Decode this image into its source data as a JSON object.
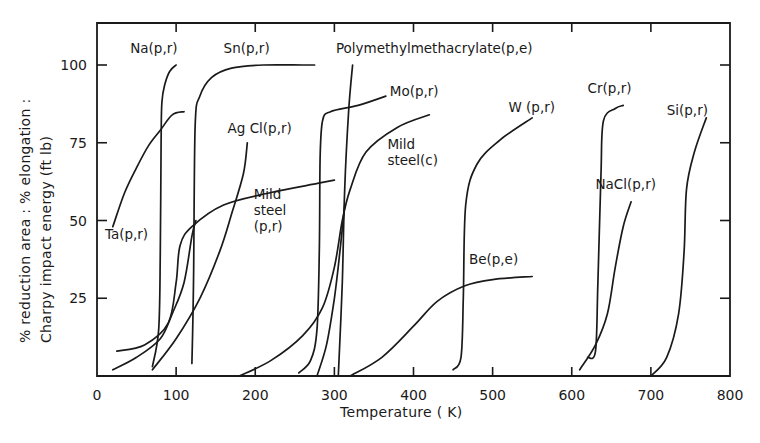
{
  "chart_data": {
    "type": "line",
    "title": "",
    "xlabel": "Temperature ( K)",
    "ylabel_line1": "% reduction area : % elongation :",
    "ylabel_line2": "Charpy impact energy (ft lb)",
    "xlim": [
      0,
      800
    ],
    "ylim": [
      0,
      112
    ],
    "grid": false,
    "legend": "inline labels",
    "x_ticks": [
      0,
      100,
      200,
      300,
      400,
      500,
      600,
      700,
      800
    ],
    "x_tick_labels": [
      "0",
      "100",
      "200",
      "300",
      "400",
      "500",
      "600",
      "700",
      "800"
    ],
    "y_ticks": [
      25,
      50,
      75,
      100
    ],
    "y_tick_labels": [
      "25",
      "50",
      "75",
      "100"
    ],
    "series": [
      {
        "name": "Na(p,r)",
        "label_lines": [
          "Na(p,r)"
        ],
        "label_pos": [
          42,
          104
        ],
        "x": [
          70,
          78,
          80,
          81,
          82,
          86,
          92,
          100
        ],
        "y": [
          3,
          15,
          40,
          75,
          88,
          94,
          98,
          100
        ]
      },
      {
        "name": "Ta(p,r)",
        "label_lines": [
          "Ta(p,r)"
        ],
        "label_pos": [
          10,
          44
        ],
        "x": [
          20,
          35,
          50,
          65,
          80,
          95,
          110
        ],
        "y": [
          48,
          59,
          67,
          74,
          79,
          84,
          85
        ]
      },
      {
        "name": "Sn(p,r)",
        "label_lines": [
          "Sn(p,r)"
        ],
        "label_pos": [
          160,
          104
        ],
        "x": [
          120,
          122,
          124,
          130,
          145,
          170,
          210,
          260,
          275
        ],
        "y": [
          4,
          30,
          80,
          90,
          96,
          99,
          100,
          100,
          100
        ]
      },
      {
        "name": "AgCl(p,r)",
        "label_lines": [
          "Ag Cl(p,r)"
        ],
        "label_pos": [
          165,
          78
        ],
        "x": [
          70,
          100,
          130,
          155,
          170,
          185,
          190
        ],
        "y": [
          2,
          12,
          25,
          40,
          52,
          65,
          75
        ]
      },
      {
        "name": "Mild steel(p,r)",
        "label_lines": [
          "Mild",
          "steel",
          "(p,r)"
        ],
        "label_pos": [
          198,
          57
        ],
        "x": [
          25,
          60,
          90,
          100,
          105,
          120,
          160,
          220,
          280,
          300
        ],
        "y": [
          8,
          10,
          17,
          30,
          42,
          48,
          55,
          59,
          62,
          63
        ]
      },
      {
        "name": "Mild steel (p,r) low",
        "label_lines": [],
        "label_pos": null,
        "x": [
          20,
          50,
          80,
          95,
          110,
          120,
          125
        ],
        "y": [
          2,
          6,
          12,
          20,
          30,
          45,
          50
        ]
      },
      {
        "name": "Polymethylmethacrylate(p,e)",
        "label_lines": [
          "Polymethylmethacrylate(p,e)"
        ],
        "label_pos": [
          302,
          104
        ],
        "x": [
          305,
          310,
          313,
          318,
          323
        ],
        "y": [
          0,
          30,
          60,
          85,
          100
        ]
      },
      {
        "name": "Mo(p,r)",
        "label_lines": [
          "Mo(p,r)"
        ],
        "label_pos": [
          370,
          90
        ],
        "x": [
          255,
          270,
          278,
          281,
          282,
          285,
          295,
          330,
          365
        ],
        "y": [
          1,
          5,
          15,
          40,
          70,
          82,
          85,
          87,
          90
        ]
      },
      {
        "name": "Mild steel(c)",
        "label_lines": [
          "Mild",
          "steel(c)"
        ],
        "label_pos": [
          367,
          73
        ],
        "x": [
          180,
          220,
          260,
          285,
          300,
          310,
          320,
          340,
          380,
          420
        ],
        "y": [
          0,
          5,
          13,
          22,
          35,
          50,
          60,
          72,
          80,
          84
        ]
      },
      {
        "name": "Mild steel(c) low",
        "label_lines": [],
        "label_pos": null,
        "x": [
          278,
          290,
          300,
          307,
          313
        ],
        "y": [
          0,
          10,
          25,
          40,
          55
        ]
      },
      {
        "name": "Be(p,e)",
        "label_lines": [
          "Be(p,e)"
        ],
        "label_pos": [
          470,
          36
        ],
        "x": [
          320,
          360,
          400,
          430,
          465,
          500,
          550
        ],
        "y": [
          0,
          6,
          16,
          24,
          29,
          31,
          32
        ]
      },
      {
        "name": "W(p,r)",
        "label_lines": [
          "W (p,r)"
        ],
        "label_pos": [
          520,
          85
        ],
        "x": [
          450,
          460,
          463,
          466,
          480,
          510,
          550
        ],
        "y": [
          2,
          6,
          25,
          55,
          68,
          76,
          83
        ]
      },
      {
        "name": "Cr(p,r)",
        "label_lines": [
          "Cr(p,r)"
        ],
        "label_pos": [
          620,
          91
        ],
        "x": [
          620,
          630,
          633,
          637,
          640,
          655,
          665
        ],
        "y": [
          6,
          8,
          30,
          65,
          82,
          86,
          87
        ]
      },
      {
        "name": "NaCl(p,r)",
        "label_lines": [
          "NaCl(p,r)"
        ],
        "label_pos": [
          630,
          60
        ],
        "x": [
          610,
          630,
          645,
          655,
          665,
          675
        ],
        "y": [
          2,
          10,
          20,
          35,
          48,
          56
        ]
      },
      {
        "name": "Si(p,r)",
        "label_lines": [
          "Si(p,r)"
        ],
        "label_pos": [
          720,
          84
        ],
        "x": [
          700,
          720,
          735,
          742,
          745,
          755,
          770
        ],
        "y": [
          0,
          6,
          20,
          40,
          60,
          72,
          83
        ]
      }
    ]
  }
}
